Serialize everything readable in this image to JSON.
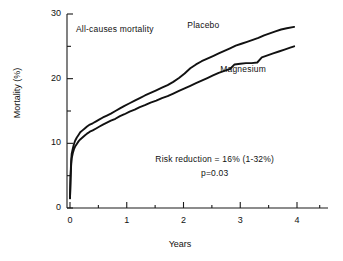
{
  "chart_data": {
    "type": "line",
    "title": "",
    "annotation_title": "All-causes mortality",
    "xlabel": "Years",
    "ylabel": "Mortality (%)",
    "xlim": [
      0,
      4.4
    ],
    "ylim": [
      0,
      30
    ],
    "xticks": [
      0,
      1,
      2,
      3,
      4
    ],
    "xticklabels": [
      "0",
      "1",
      "2",
      "3",
      "4"
    ],
    "xminorticks": [
      0.5,
      1.5,
      2.5,
      3.5
    ],
    "yticks": [
      0,
      10,
      20,
      30
    ],
    "yticklabels": [
      "0",
      "10",
      "20",
      "30"
    ],
    "yminorticks": [
      5,
      15,
      25
    ],
    "grid": false,
    "legend": "inline-labels",
    "series": [
      {
        "name": "Placebo",
        "label_x": 2.35,
        "label_y": 28.2,
        "color": "#111111",
        "points": [
          [
            0.0,
            1.5
          ],
          [
            0.01,
            5.0
          ],
          [
            0.02,
            7.2
          ],
          [
            0.03,
            8.4
          ],
          [
            0.05,
            9.2
          ],
          [
            0.07,
            9.9
          ],
          [
            0.09,
            10.4
          ],
          [
            0.12,
            10.9
          ],
          [
            0.15,
            11.3
          ],
          [
            0.18,
            11.7
          ],
          [
            0.22,
            12.0
          ],
          [
            0.26,
            12.3
          ],
          [
            0.3,
            12.6
          ],
          [
            0.35,
            12.9
          ],
          [
            0.4,
            13.1
          ],
          [
            0.46,
            13.4
          ],
          [
            0.52,
            13.7
          ],
          [
            0.58,
            14.0
          ],
          [
            0.65,
            14.3
          ],
          [
            0.72,
            14.6
          ],
          [
            0.8,
            15.0
          ],
          [
            0.88,
            15.4
          ],
          [
            0.96,
            15.8
          ],
          [
            1.05,
            16.2
          ],
          [
            1.14,
            16.6
          ],
          [
            1.23,
            17.0
          ],
          [
            1.32,
            17.4
          ],
          [
            1.42,
            17.8
          ],
          [
            1.52,
            18.2
          ],
          [
            1.62,
            18.6
          ],
          [
            1.72,
            19.0
          ],
          [
            1.82,
            19.5
          ],
          [
            1.92,
            20.1
          ],
          [
            2.02,
            20.8
          ],
          [
            2.12,
            21.6
          ],
          [
            2.22,
            22.2
          ],
          [
            2.32,
            22.7
          ],
          [
            2.42,
            23.1
          ],
          [
            2.52,
            23.5
          ],
          [
            2.62,
            23.9
          ],
          [
            2.72,
            24.3
          ],
          [
            2.82,
            24.7
          ],
          [
            2.92,
            25.1
          ],
          [
            3.02,
            25.4
          ],
          [
            3.12,
            25.7
          ],
          [
            3.22,
            26.0
          ],
          [
            3.32,
            26.3
          ],
          [
            3.42,
            26.7
          ],
          [
            3.52,
            27.0
          ],
          [
            3.62,
            27.3
          ],
          [
            3.72,
            27.6
          ],
          [
            3.82,
            27.8
          ],
          [
            3.95,
            28.0
          ]
        ]
      },
      {
        "name": "Magnesium",
        "label_x": 3.05,
        "label_y": 21.4,
        "color": "#111111",
        "points": [
          [
            0.0,
            1.5
          ],
          [
            0.01,
            4.6
          ],
          [
            0.02,
            6.6
          ],
          [
            0.03,
            7.7
          ],
          [
            0.05,
            8.5
          ],
          [
            0.07,
            9.1
          ],
          [
            0.09,
            9.5
          ],
          [
            0.12,
            9.9
          ],
          [
            0.15,
            10.3
          ],
          [
            0.18,
            10.6
          ],
          [
            0.22,
            10.9
          ],
          [
            0.26,
            11.2
          ],
          [
            0.3,
            11.5
          ],
          [
            0.35,
            11.8
          ],
          [
            0.4,
            12.0
          ],
          [
            0.46,
            12.3
          ],
          [
            0.52,
            12.6
          ],
          [
            0.58,
            12.9
          ],
          [
            0.65,
            13.2
          ],
          [
            0.72,
            13.5
          ],
          [
            0.8,
            13.8
          ],
          [
            0.88,
            14.2
          ],
          [
            0.96,
            14.5
          ],
          [
            1.05,
            14.9
          ],
          [
            1.14,
            15.2
          ],
          [
            1.23,
            15.6
          ],
          [
            1.32,
            15.9
          ],
          [
            1.42,
            16.3
          ],
          [
            1.52,
            16.6
          ],
          [
            1.62,
            17.0
          ],
          [
            1.72,
            17.3
          ],
          [
            1.82,
            17.7
          ],
          [
            1.92,
            18.1
          ],
          [
            2.02,
            18.5
          ],
          [
            2.12,
            18.9
          ],
          [
            2.22,
            19.3
          ],
          [
            2.32,
            19.7
          ],
          [
            2.42,
            20.1
          ],
          [
            2.52,
            20.5
          ],
          [
            2.62,
            20.9
          ],
          [
            2.72,
            21.2
          ],
          [
            2.82,
            21.5
          ],
          [
            2.9,
            22.2
          ],
          [
            3.0,
            22.3
          ],
          [
            3.1,
            22.4
          ],
          [
            3.2,
            22.4
          ],
          [
            3.3,
            22.5
          ],
          [
            3.38,
            23.3
          ],
          [
            3.48,
            23.6
          ],
          [
            3.58,
            23.9
          ],
          [
            3.68,
            24.2
          ],
          [
            3.78,
            24.5
          ],
          [
            3.88,
            24.8
          ],
          [
            3.95,
            25.0
          ]
        ]
      }
    ],
    "annotations": [
      {
        "id": "risk-reduction",
        "text": "Risk reduction = 16% (1-32%)",
        "x": 2.55,
        "y": 7.4
      },
      {
        "id": "p-value",
        "text": "p=0.03",
        "x": 2.55,
        "y": 5.3
      }
    ]
  }
}
